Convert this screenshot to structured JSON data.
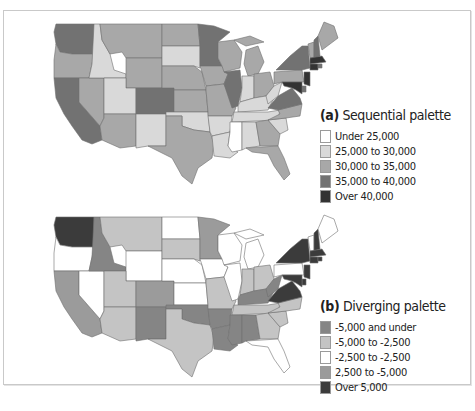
{
  "figure": {
    "panels": [
      {
        "id": "a",
        "label": "(a)",
        "title": "Sequential palette",
        "legend": [
          {
            "label": "Under 25,000",
            "color": "#ffffff"
          },
          {
            "label": "25,000 to 30,000",
            "color": "#d9d9d9"
          },
          {
            "label": "30,000 to 35,000",
            "color": "#a8a8a8"
          },
          {
            "label": "35,000 to 40,000",
            "color": "#727272"
          },
          {
            "label": "Over 40,000",
            "color": "#333333"
          }
        ]
      },
      {
        "id": "b",
        "label": "(b)",
        "title": "Diverging palette",
        "legend": [
          {
            "label": "-5,000 and under",
            "color": "#858585"
          },
          {
            "label": "-5,000 to -2,500",
            "color": "#c4c4c4"
          },
          {
            "label": "-2,500 to -2,500",
            "color": "#ffffff"
          },
          {
            "label": "2,500 to -5,000",
            "color": "#9b9b9b"
          },
          {
            "label": "Over 5,000",
            "color": "#3b3b3b"
          }
        ]
      }
    ]
  },
  "chart_data": [
    {
      "type": "choropleth",
      "title": "(a) Sequential palette",
      "legend_position": "right",
      "classes": [
        "Under 25,000",
        "25,000 to 30,000",
        "30,000 to 35,000",
        "35,000 to 40,000",
        "Over 40,000"
      ],
      "states": {
        "WA": 3,
        "OR": 2,
        "CA": 3,
        "NV": 2,
        "ID": 1,
        "MT": 2,
        "WY": 2,
        "UT": 1,
        "AZ": 2,
        "CO": 3,
        "NM": 1,
        "ND": 2,
        "SD": 1,
        "NE": 2,
        "KS": 2,
        "OK": 1,
        "TX": 2,
        "MN": 3,
        "IA": 2,
        "MO": 2,
        "AR": 1,
        "LA": 1,
        "WI": 2,
        "IL": 3,
        "MI": 2,
        "IN": 1,
        "OH": 2,
        "KY": 1,
        "TN": 1,
        "MS": 0,
        "AL": 1,
        "GA": 2,
        "FL": 2,
        "SC": 1,
        "NC": 2,
        "VA": 3,
        "WV": 1,
        "PA": 2,
        "NY": 3,
        "VT": 2,
        "NH": 3,
        "ME": 2,
        "MA": 4,
        "CT": 4,
        "RI": 3,
        "NJ": 4,
        "DE": 3,
        "MD": 4
      }
    },
    {
      "type": "choropleth",
      "title": "(b) Diverging palette",
      "legend_position": "right",
      "classes": [
        "-5,000 and under",
        "-5,000 to -2,500",
        "-2,500 to -2,500",
        "2,500 to -5,000",
        "Over 5,000"
      ],
      "states": {
        "WA": 4,
        "OR": 2,
        "CA": 3,
        "NV": 2,
        "ID": 0,
        "MT": 1,
        "WY": 2,
        "UT": 1,
        "AZ": 1,
        "CO": 3,
        "NM": 0,
        "ND": 2,
        "SD": 1,
        "NE": 2,
        "KS": 2,
        "OK": 0,
        "TX": 1,
        "MN": 3,
        "IA": 2,
        "MO": 1,
        "AR": 0,
        "LA": 0,
        "WI": 2,
        "IL": 2,
        "MI": 2,
        "IN": 1,
        "OH": 1,
        "KY": 0,
        "TN": 1,
        "MS": 0,
        "AL": 0,
        "GA": 1,
        "FL": 2,
        "SC": 1,
        "NC": 1,
        "VA": 4,
        "WV": 0,
        "PA": 2,
        "NY": 4,
        "VT": 2,
        "NH": 4,
        "ME": 2,
        "MA": 4,
        "CT": 4,
        "RI": 4,
        "NJ": 4,
        "DE": 4,
        "MD": 4
      }
    }
  ]
}
